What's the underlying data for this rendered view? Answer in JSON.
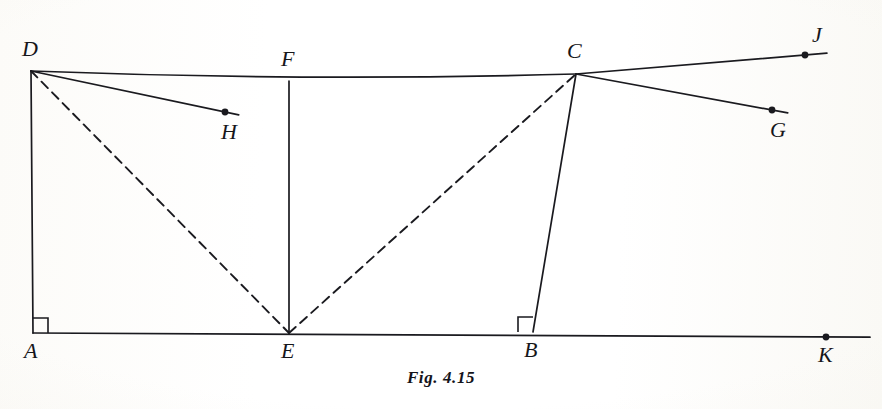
{
  "figure": {
    "caption": "Fig. 4.15",
    "ink_color": "#1a1a1f",
    "background_color": "#fdfdfb"
  },
  "points": [
    {
      "id": "A",
      "label": "A",
      "x": 33,
      "y": 333,
      "label_x": 24,
      "label_y": 340,
      "marked_dot": false
    },
    {
      "id": "B",
      "label": "B",
      "x": 533,
      "y": 332,
      "label_x": 524,
      "label_y": 339,
      "marked_dot": false
    },
    {
      "id": "C",
      "label": "C",
      "x": 576,
      "y": 74,
      "label_x": 567,
      "label_y": 40,
      "marked_dot": false
    },
    {
      "id": "D",
      "label": "D",
      "x": 31,
      "y": 71,
      "label_x": 22,
      "label_y": 38,
      "marked_dot": false
    },
    {
      "id": "E",
      "label": "E",
      "x": 289,
      "y": 333,
      "label_x": 281,
      "label_y": 340,
      "marked_dot": false
    },
    {
      "id": "F",
      "label": "F",
      "x": 289,
      "y": 81,
      "label_x": 281,
      "label_y": 48,
      "marked_dot": false
    },
    {
      "id": "G",
      "label": "G",
      "x": 772,
      "y": 110,
      "label_x": 770,
      "label_y": 119,
      "marked_dot": true
    },
    {
      "id": "H",
      "label": "H",
      "x": 225,
      "y": 112,
      "label_x": 221,
      "label_y": 121,
      "marked_dot": true
    },
    {
      "id": "J",
      "label": "J",
      "x": 805,
      "y": 55,
      "label_x": 812,
      "label_y": 24,
      "marked_dot": true
    },
    {
      "id": "K",
      "label": "K",
      "x": 826,
      "y": 337,
      "label_x": 818,
      "label_y": 344,
      "marked_dot": true
    }
  ],
  "segments": [
    {
      "name": "top-edge-d-to-c",
      "style": "solid",
      "from": "D",
      "to": "C",
      "curved": true
    },
    {
      "name": "left-edge-d-to-a",
      "style": "solid",
      "from": "D",
      "to": "A",
      "curved": false
    },
    {
      "name": "mid-edge-f-to-e",
      "style": "solid",
      "from": "F",
      "to": "E",
      "curved": false
    },
    {
      "name": "right-edge-c-to-b",
      "style": "solid",
      "from": "C",
      "to": "B",
      "curved": false
    },
    {
      "name": "base-a-to-k",
      "style": "solid",
      "from": "A",
      "to": "K",
      "curved": false
    },
    {
      "name": "diagonal-d-to-e",
      "style": "dashed",
      "from": "D",
      "to": "E",
      "curved": false
    },
    {
      "name": "diagonal-e-to-c",
      "style": "dashed",
      "from": "E",
      "to": "C",
      "curved": false
    },
    {
      "name": "ray-d-to-h",
      "style": "solid",
      "from": "D",
      "to": "H",
      "curved": false
    },
    {
      "name": "ray-c-to-j",
      "style": "solid",
      "from": "C",
      "to": "J",
      "curved": false
    },
    {
      "name": "ray-c-to-g",
      "style": "solid",
      "from": "C",
      "to": "G",
      "curved": false
    }
  ],
  "right_angles": [
    {
      "name": "right-angle-at-a",
      "vertex": "A",
      "size": 15,
      "dir_x": 1,
      "dir_y": -1
    },
    {
      "name": "right-angle-at-b",
      "vertex": "B",
      "size": 15,
      "dir_x": -1,
      "dir_y": -1
    }
  ]
}
